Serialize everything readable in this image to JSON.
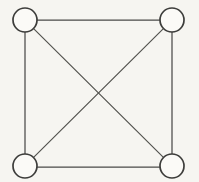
{
  "diagram": {
    "title": "Complete graph K4",
    "type": "graph",
    "background_color": "#f6f5f1",
    "edge_color": "#4a4a48",
    "node_stroke_color": "#3d3d3b",
    "node_fill_color": "#fbfaf7",
    "node_radius": 12,
    "edge_width": 1.25,
    "node_count": "4",
    "edge_count": "6",
    "nodes": [
      {
        "id": "top-left",
        "label": "",
        "cx": 25,
        "cy": 20
      },
      {
        "id": "top-right",
        "label": "",
        "cx": 172,
        "cy": 20
      },
      {
        "id": "bottom-left",
        "label": "",
        "cx": 25,
        "cy": 166
      },
      {
        "id": "bottom-right",
        "label": "",
        "cx": 172,
        "cy": 166
      }
    ],
    "edges": [
      {
        "id": "top-edge",
        "from": "top-left",
        "to": "top-right",
        "kind": "side",
        "x1": 37,
        "y1": 20,
        "x2": 160,
        "y2": 20
      },
      {
        "id": "bottom-edge",
        "from": "bottom-left",
        "to": "bottom-right",
        "kind": "side",
        "x1": 37,
        "y1": 167,
        "x2": 160,
        "y2": 167
      },
      {
        "id": "left-edge",
        "from": "top-left",
        "to": "bottom-left",
        "kind": "side",
        "x1": 25,
        "y1": 32,
        "x2": 25,
        "y2": 154
      },
      {
        "id": "right-edge",
        "from": "top-right",
        "to": "bottom-right",
        "kind": "side",
        "x1": 172,
        "y1": 32,
        "x2": 172,
        "y2": 154
      },
      {
        "id": "diagonal-tl-br",
        "from": "top-left",
        "to": "bottom-right",
        "kind": "diagonal",
        "x1": 33.6,
        "y1": 28.6,
        "x2": 163.4,
        "y2": 157.4
      },
      {
        "id": "diagonal-tr-bl",
        "from": "top-right",
        "to": "bottom-left",
        "kind": "diagonal",
        "x1": 163.4,
        "y1": 28.6,
        "x2": 33.6,
        "y2": 157.4
      }
    ],
    "crossing_point": {
      "x": 98,
      "y": 93
    }
  }
}
